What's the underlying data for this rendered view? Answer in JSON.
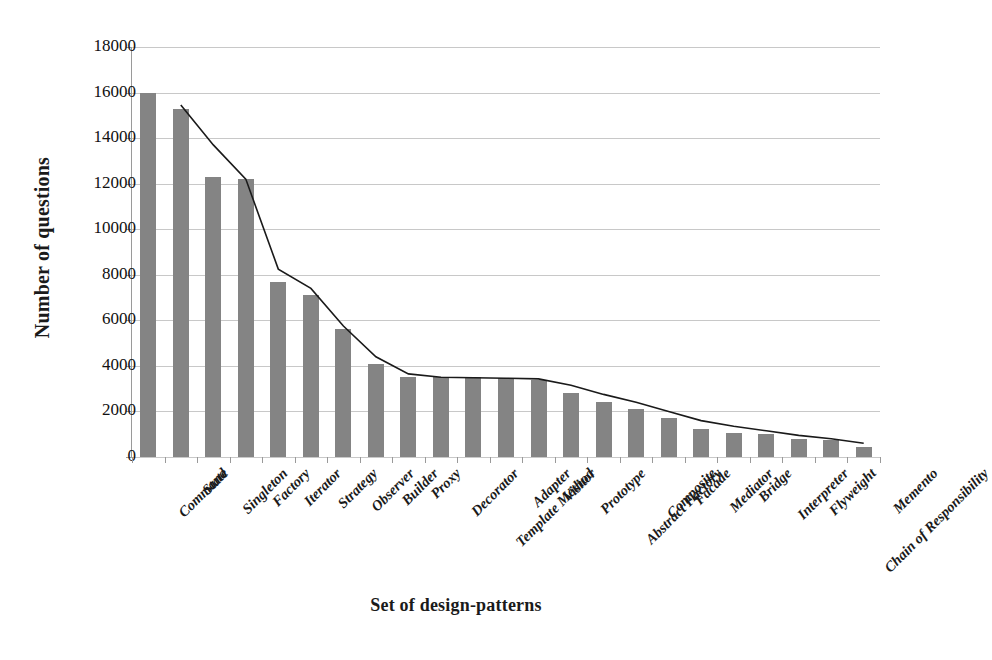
{
  "chart_data": {
    "type": "bar",
    "title": "",
    "xlabel": "Set of design-patterns",
    "ylabel": "Number of questions",
    "ylim": [
      0,
      18000
    ],
    "ytick_step": 2000,
    "yticks": [
      0,
      2000,
      4000,
      6000,
      8000,
      10000,
      12000,
      14000,
      16000,
      18000
    ],
    "ytick_labels": [
      "0",
      "2000",
      "4000",
      "6000",
      "8000",
      "10000",
      "12000",
      "14000",
      "16000",
      "18000"
    ],
    "grid": true,
    "legend": "none",
    "bar_color": "#848484",
    "line_color": "#1a1a1a",
    "categories": [
      "Command",
      "State",
      "Singleton",
      "Factory",
      "Iterator",
      "Strategy",
      "Observer",
      "Builder",
      "Proxy",
      "Decorator",
      "Template Method",
      "Adapter",
      "Visitor",
      "Prototype",
      "Abstract Factory",
      "Composite",
      "Facade",
      "Mediator",
      "Bridge",
      "Interpreter",
      "Flyweight",
      "Chain of Responsibility",
      "Memento"
    ],
    "series": [
      {
        "name": "Number of questions",
        "type": "bar",
        "values": [
          16000,
          15300,
          12300,
          12200,
          7700,
          7100,
          5600,
          4100,
          3500,
          3500,
          3500,
          3450,
          3400,
          2800,
          2400,
          2100,
          1700,
          1250,
          1050,
          1000,
          800,
          750,
          450
        ]
      },
      {
        "name": "Trend",
        "type": "line",
        "values": [
          null,
          15450,
          13700,
          12200,
          8250,
          7400,
          5750,
          4400,
          3650,
          3500,
          3480,
          3460,
          3430,
          3150,
          2750,
          2400,
          2000,
          1600,
          1350,
          1150,
          950,
          800,
          600
        ]
      }
    ]
  }
}
